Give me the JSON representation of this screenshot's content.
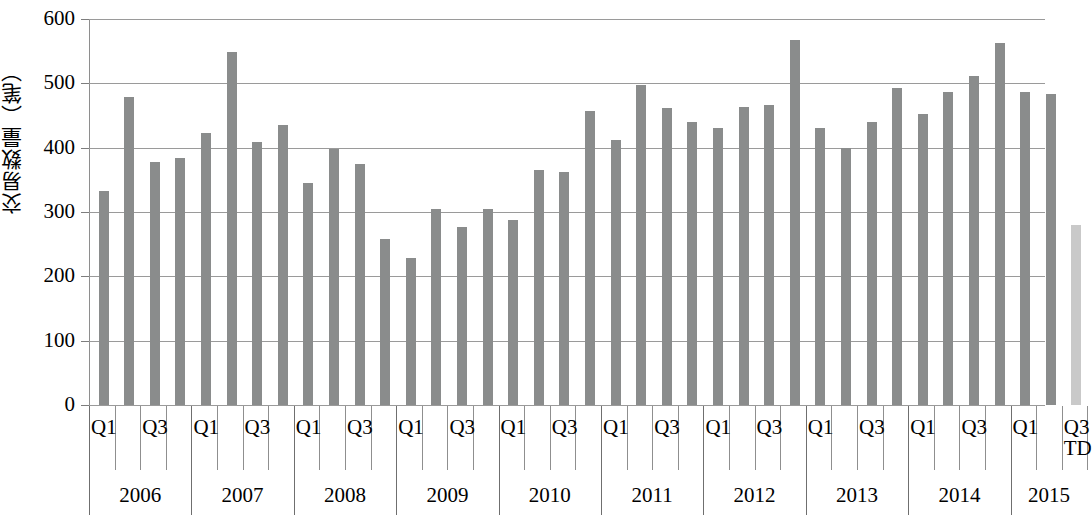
{
  "chart_data": {
    "type": "bar",
    "title": "",
    "xlabel": "",
    "ylabel": "交易数量（笔）",
    "ylim": [
      0,
      600
    ],
    "ytick_values": [
      600,
      500,
      400,
      300,
      200,
      100,
      0
    ],
    "ytick_labels": [
      "600",
      "500",
      "400",
      "300",
      "200",
      "100",
      "0"
    ],
    "grid": "horizontal",
    "legend": "none",
    "bar_color": "#8a8c8c",
    "highlight_bar_color": "#c9c9c9",
    "categories": [
      "2006 Q1",
      "2006 Q2",
      "2006 Q3",
      "2006 Q4",
      "2007 Q1",
      "2007 Q2",
      "2007 Q3",
      "2007 Q4",
      "2008 Q1",
      "2008 Q2",
      "2008 Q3",
      "2008 Q4",
      "2009 Q1",
      "2009 Q2",
      "2009 Q3",
      "2009 Q4",
      "2010 Q1",
      "2010 Q2",
      "2010 Q3",
      "2010 Q4",
      "2011 Q1",
      "2011 Q2",
      "2011 Q3",
      "2011 Q4",
      "2012 Q1",
      "2012 Q2",
      "2012 Q3",
      "2012 Q4",
      "2013 Q1",
      "2013 Q2",
      "2013 Q3",
      "2013 Q4",
      "2014 Q1",
      "2014 Q2",
      "2014 Q3",
      "2014 Q4",
      "2015 Q1",
      "2015 Q2",
      "2015 Q3TD"
    ],
    "values": [
      332,
      479,
      378,
      384,
      423,
      548,
      409,
      436,
      345,
      398,
      374,
      258,
      228,
      304,
      276,
      305,
      288,
      366,
      362,
      457,
      412,
      497,
      461,
      440,
      431,
      464,
      466,
      567,
      431,
      399,
      440,
      493,
      452,
      487,
      512,
      562,
      487,
      483,
      280
    ],
    "x_axis": {
      "quarter_ticks": [
        "Q1",
        "Q3"
      ],
      "last_label_main": "Q3",
      "last_label_sub": "TD",
      "years": [
        "2006",
        "2007",
        "2008",
        "2009",
        "2010",
        "2011",
        "2012",
        "2013",
        "2014",
        "2015"
      ]
    }
  }
}
